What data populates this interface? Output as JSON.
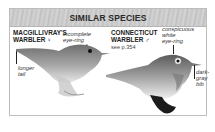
{
  "header": {
    "title": "SIMILAR SPECIES"
  },
  "species": [
    {
      "name_line1": "MACGILLIVRAY'S",
      "name_line2": "WARBLER ♀",
      "sex": "female",
      "callouts": [
        {
          "text_line1": "incomplete",
          "text_line2": "eye-ring"
        },
        {
          "text_line1": "longer",
          "text_line2": "tail"
        }
      ]
    },
    {
      "name_line1": "CONNECTICUT",
      "name_line2": "WARBLER ♂",
      "sex": "male",
      "see_also": "see p.354",
      "callouts": [
        {
          "text_line1": "conspicuous",
          "text_line2": "white",
          "text_line3": "eye-ring"
        },
        {
          "text_line1": "dark-",
          "text_line2": "gray",
          "text_line3": "bib"
        }
      ]
    }
  ],
  "colors": {
    "header_bg": "#c9c9c9",
    "border": "#bdbdbd",
    "text": "#222222"
  }
}
